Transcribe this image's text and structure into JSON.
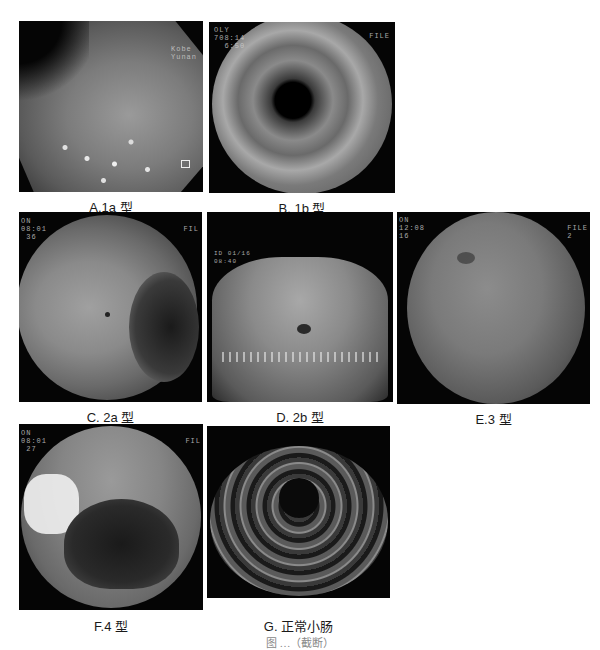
{
  "figure": {
    "panels": [
      {
        "id": "A",
        "label": "A.1a 型",
        "osd_right": "Kobe\nYunan",
        "osd_left": "",
        "description": "endoscopic-view-flat-mucosa"
      },
      {
        "id": "B",
        "label": "B. 1b 型",
        "osd_left": "OLY\n708:14\n  6:50",
        "osd_right": "FILE",
        "description": "endoscopic-view-tubular-lumen"
      },
      {
        "id": "C",
        "label": "C. 2a 型",
        "osd_left": "ON\n08:01\n 36",
        "osd_right": "FIL",
        "description": "endoscopic-view-folds-with-lesion"
      },
      {
        "id": "D",
        "label": "D. 2b 型",
        "osd_left": "ID 01/16\n08:40",
        "osd_right": "",
        "description": "endoscopic-view-ulcer-lesion"
      },
      {
        "id": "E",
        "label": "E.3 型",
        "osd_left": "ON\n12:08\n16",
        "osd_right": "FILE\n2",
        "description": "endoscopic-view-vascular-lesion"
      },
      {
        "id": "F",
        "label": "F.4 型",
        "osd_left": "ON\n08:01\n 27",
        "osd_right": "FIL",
        "description": "endoscopic-view-bleeding-lumen"
      },
      {
        "id": "G",
        "label": "G. 正常小肠",
        "osd_left": "",
        "osd_right": "",
        "description": "endoscopic-view-normal-small-intestine"
      }
    ],
    "caption": "图 …（截断）"
  },
  "colors": {
    "background": "#ffffff",
    "panel_bg": "#050505",
    "tissue_mid": "#7a7a7a",
    "tissue_light": "#b0b0b0",
    "label_text": "#1a1a1a"
  }
}
